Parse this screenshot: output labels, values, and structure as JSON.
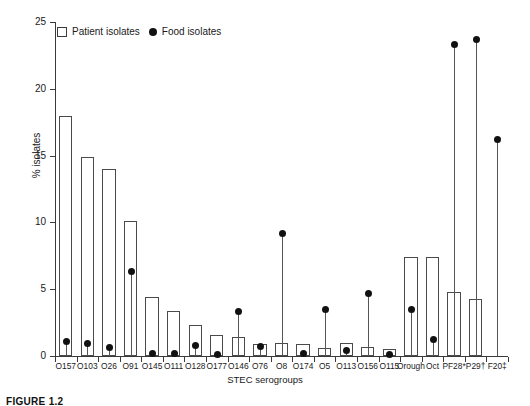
{
  "figure": {
    "caption": "FIGURE 1.2"
  },
  "legend": {
    "patient_label": "Patient isolates",
    "food_label": "Food isolates",
    "patient_marker": "open-square-marker",
    "food_marker": "filled-circle-marker"
  },
  "chart_data": {
    "type": "bar",
    "title": "",
    "xlabel": "STEC serogroups",
    "ylabel": "% isolates",
    "ylim": [
      0,
      25
    ],
    "yticks": [
      0,
      5,
      10,
      15,
      20,
      25
    ],
    "grid": false,
    "legend_position": "top-left",
    "categories": [
      "O157",
      "O103",
      "O26",
      "O91",
      "O145",
      "O111",
      "O128",
      "O177",
      "O146",
      "O76",
      "O8",
      "O174",
      "O5",
      "O113",
      "O156",
      "O115",
      "Orough",
      "Oct",
      "PF28*",
      "P29†",
      "F20‡"
    ],
    "series": [
      {
        "name": "Patient isolates",
        "marker": "bar",
        "values": [
          18.0,
          14.9,
          14.0,
          10.1,
          4.4,
          3.4,
          2.3,
          1.6,
          1.4,
          0.9,
          1.0,
          0.9,
          0.6,
          1.0,
          0.7,
          0.5,
          7.4,
          7.4,
          4.8,
          4.3,
          0.0
        ]
      },
      {
        "name": "Food isolates",
        "marker": "stem-dot",
        "values": [
          1.1,
          0.9,
          0.6,
          6.3,
          0.2,
          0.2,
          0.8,
          0.1,
          3.3,
          0.7,
          9.2,
          0.2,
          3.5,
          0.4,
          4.7,
          0.1,
          3.5,
          1.2,
          23.3,
          23.7,
          16.2
        ]
      }
    ]
  }
}
